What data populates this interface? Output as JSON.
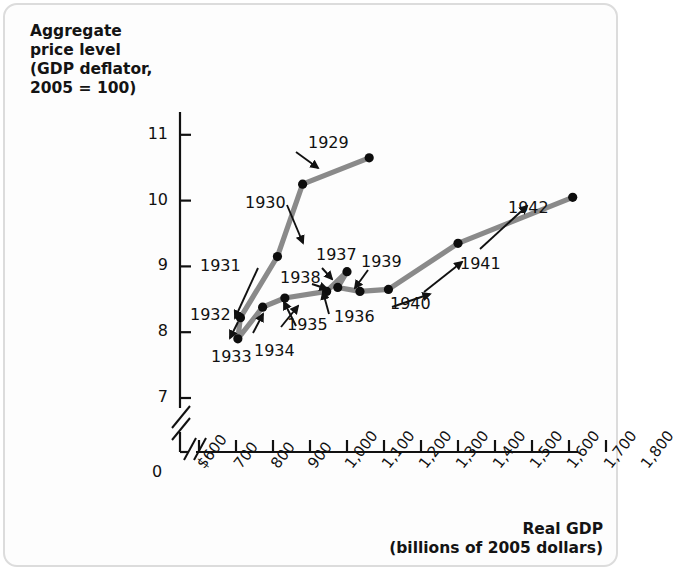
{
  "chart_data": {
    "type": "line",
    "title": "",
    "ylabel_lines": [
      "Aggregate",
      "price level",
      "(GDP deflator,",
      "2005 = 100)"
    ],
    "xlabel_lines": [
      "Real GDP",
      "(billions of 2005 dollars)"
    ],
    "xlabel": "Real GDP (billions of 2005 dollars)",
    "ylabel": "Aggregate price level (GDP deflator, 2005 = 100)",
    "xlim": [
      600,
      1800
    ],
    "ylim": [
      7,
      11
    ],
    "grid": false,
    "legend": "none",
    "axis_break_x": true,
    "axis_break_y": true,
    "origin_label": "0",
    "yticks": [
      7,
      8,
      9,
      10,
      11
    ],
    "ytick_labels": [
      "7",
      "8",
      "9",
      "10",
      "11"
    ],
    "xticks": [
      600,
      700,
      800,
      900,
      1000,
      1100,
      1200,
      1300,
      1400,
      1500,
      1600,
      1700,
      1800
    ],
    "xtick_labels": [
      "$600",
      "700",
      "800",
      "900",
      "1,000",
      "1,100",
      "1,200",
      "1,300",
      "1,400",
      "1,500",
      "1,600",
      "1,700",
      "1,800"
    ],
    "series_name": "U.S. economy 1929-1942",
    "line_color": "#8a8a8a",
    "marker_color": "#0d0d0d",
    "points": [
      {
        "label": "1929",
        "x": 1060,
        "y": 10.65
      },
      {
        "label": "1930",
        "x": 880,
        "y": 10.25
      },
      {
        "label": "1931",
        "x": 812,
        "y": 9.15
      },
      {
        "label": "1932",
        "x": 712,
        "y": 8.22
      },
      {
        "label": "1933",
        "x": 705,
        "y": 7.9
      },
      {
        "label": "1934",
        "x": 772,
        "y": 8.38
      },
      {
        "label": "1935",
        "x": 832,
        "y": 8.52
      },
      {
        "label": "1936",
        "x": 945,
        "y": 8.62
      },
      {
        "label": "1937",
        "x": 1000,
        "y": 8.92
      },
      {
        "label": "1938",
        "x": 975,
        "y": 8.68
      },
      {
        "label": "1939",
        "x": 1035,
        "y": 8.62
      },
      {
        "label": "1940",
        "x": 1112,
        "y": 8.65
      },
      {
        "label": "1941",
        "x": 1300,
        "y": 9.35
      },
      {
        "label": "1942",
        "x": 1610,
        "y": 10.05
      }
    ]
  }
}
